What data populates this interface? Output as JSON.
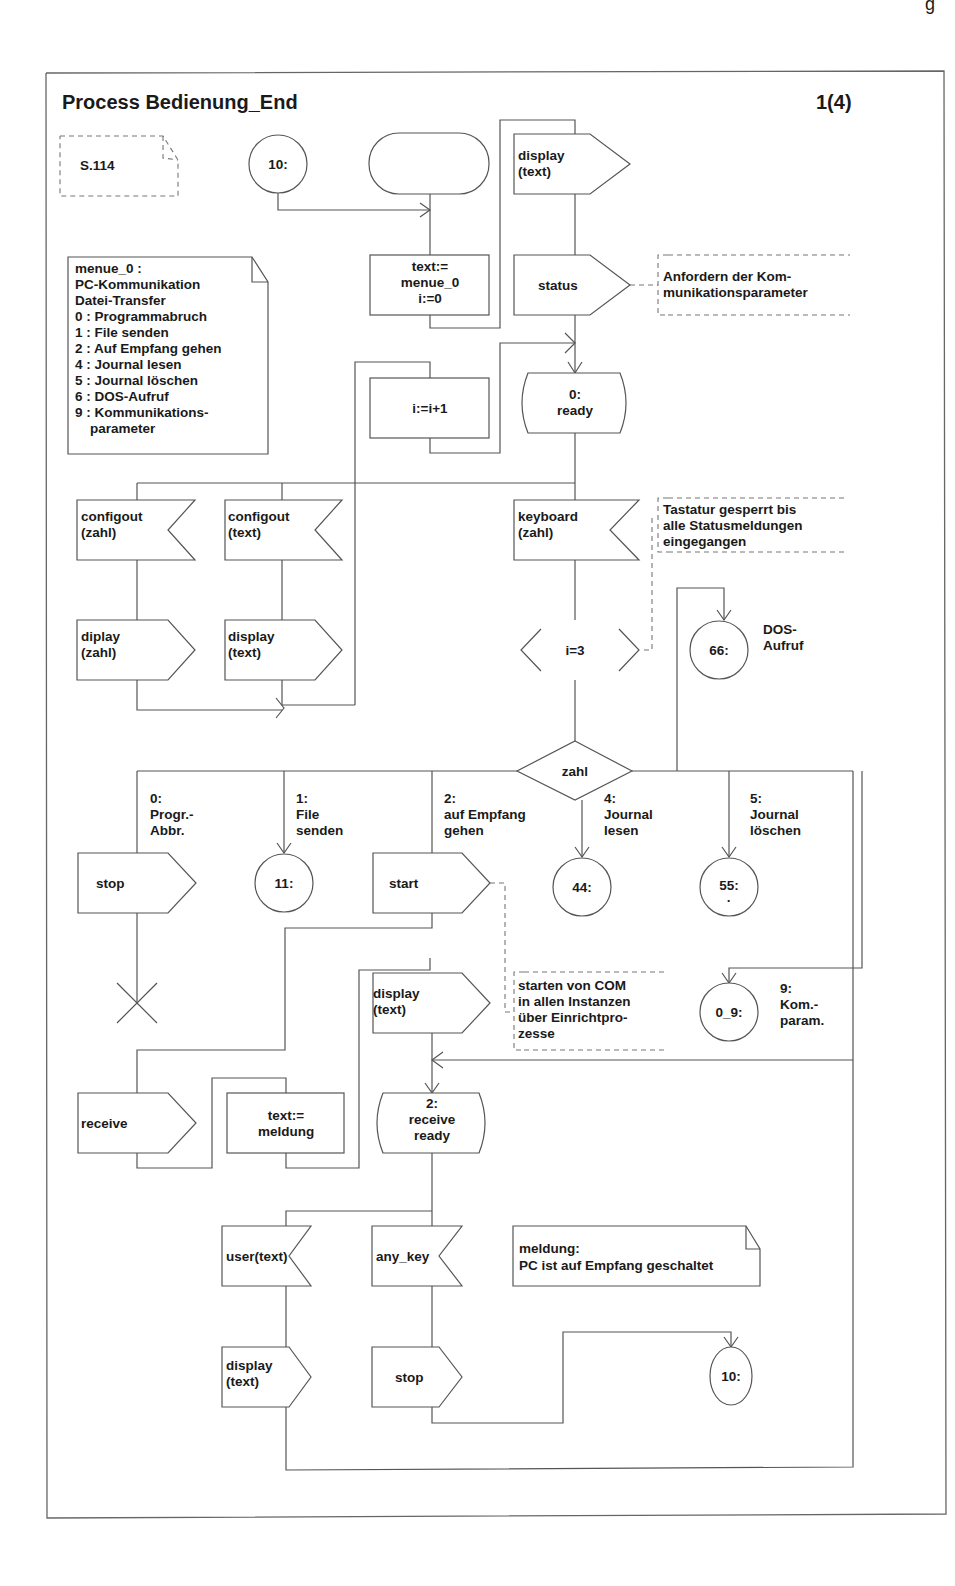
{
  "header_fragment": "g",
  "diagram": {
    "title": "Process Bedienung_End",
    "page": "1(4)",
    "reference_note": "S.114",
    "menu_note": {
      "lines": [
        "menue_0 :",
        "PC-Kommunikation",
        "Datei-Transfer",
        "0 : Programmabruch",
        "1 : File senden",
        "2 : Auf Empfang gehen",
        "4 : Journal lesen",
        "5 : Journal löschen",
        "6 : DOS-Aufruf",
        "9 : Kommunikations-",
        "    parameter"
      ]
    },
    "connectors": {
      "c10_top": "10:",
      "c11": "11:",
      "c44": "44:",
      "c55": "55:",
      "c55_dot": "·",
      "c66": "66:",
      "c0_9": "0_9:",
      "c10_bottom": "10:"
    },
    "tasks": {
      "init": [
        "text:=",
        "menue_0",
        "i:=0"
      ],
      "inc": "i:=i+1",
      "meldung": [
        "text:=",
        "meldung"
      ]
    },
    "outputs": {
      "display_text_top": [
        "display",
        "(text)"
      ],
      "status": "status",
      "diplay_zahl": [
        "diplay",
        "(zahl)"
      ],
      "display_text_left": [
        "display",
        "(text)"
      ],
      "stop_0": "stop",
      "start": "start",
      "display_text_mid": [
        "display",
        "(text)"
      ],
      "receive": "receive",
      "display_text_bottom": [
        "display",
        "(text)"
      ],
      "stop_bottom": "stop"
    },
    "inputs": {
      "configout_zahl": [
        "configout",
        "(zahl)"
      ],
      "configout_text": [
        "configout",
        "(text)"
      ],
      "keyboard_zahl": [
        "keyboard",
        "(zahl)"
      ],
      "user_text": "user(text)",
      "any_key": "any_key"
    },
    "states": {
      "ready": [
        "0:",
        "ready"
      ],
      "receive_ready": [
        "2:",
        "receive",
        "ready"
      ]
    },
    "enabling_condition": "i=3",
    "decision": "zahl",
    "branches": {
      "b0": [
        "0:",
        "Progr.-",
        "Abbr."
      ],
      "b1": [
        "1:",
        "File",
        "senden"
      ],
      "b2": [
        "2:",
        "auf Empfang",
        "gehen"
      ],
      "b4": [
        "4:",
        "Journal",
        "lesen"
      ],
      "b5": [
        "5:",
        "Journal",
        "löschen"
      ],
      "b6": [
        "DOS-",
        "Aufruf"
      ],
      "b9": [
        "9:",
        "Kom.-",
        "param."
      ]
    },
    "comments": {
      "status_comment": [
        "Anfordern der Kom-",
        "munikationsparameter"
      ],
      "keyboard_comment": [
        "Tastatur gesperrt bis",
        "alle Statusmeldungen",
        "eingegangen"
      ],
      "start_comment": [
        "starten von COM",
        "in allen Instanzen",
        "über Einrichtpro-",
        "zesse"
      ],
      "meldung_note": [
        "meldung:",
        "PC ist auf Empfang geschaltet"
      ]
    }
  }
}
